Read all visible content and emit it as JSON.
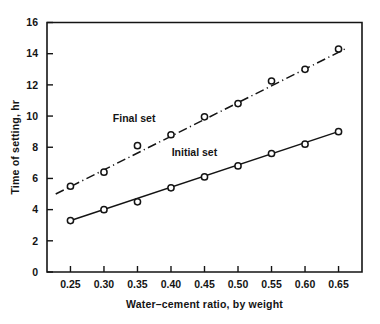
{
  "chart_data": {
    "type": "line",
    "title": "",
    "subtitle": "",
    "xlabel": "Water–cement ratio, by weight",
    "ylabel": "Time of setting, hr",
    "x": [
      0.25,
      0.3,
      0.35,
      0.4,
      0.45,
      0.5,
      0.55,
      0.6,
      0.65
    ],
    "xlim": [
      0.215,
      0.685
    ],
    "ylim": [
      0,
      16
    ],
    "xticks": [
      0.25,
      0.3,
      0.35,
      0.4,
      0.45,
      0.5,
      0.55,
      0.6,
      0.65
    ],
    "xtick_labels": [
      "0.25",
      "0.30",
      "0.35",
      "0.40",
      "0.45",
      "0.50",
      "0.55",
      "0.60",
      "0.65"
    ],
    "yticks": [
      0,
      2,
      4,
      6,
      8,
      10,
      12,
      14,
      16
    ],
    "ytick_labels": [
      "0",
      "2",
      "4",
      "6",
      "8",
      "10",
      "12",
      "14",
      "16"
    ],
    "grid": false,
    "legend_position": "inline-annotation",
    "series": [
      {
        "name": "Final set",
        "line_style": "dash-dot",
        "marker": "open-circle",
        "color": "#141414",
        "values": [
          5.5,
          6.4,
          8.1,
          8.8,
          9.95,
          10.8,
          12.25,
          13.0,
          14.3
        ],
        "trend_line": {
          "x_start": 0.228,
          "y_start": 5.0,
          "x_end": 0.662,
          "y_end": 14.35
        },
        "annotation": {
          "text": "Final set",
          "x": 0.345,
          "y": 9.6
        }
      },
      {
        "name": "Initial set",
        "line_style": "solid",
        "marker": "open-circle",
        "color": "#141414",
        "values": [
          3.3,
          4.0,
          4.5,
          5.4,
          6.1,
          6.8,
          7.6,
          8.2,
          9.0
        ],
        "trend_line": {
          "x_start": 0.247,
          "y_start": 3.25,
          "x_end": 0.653,
          "y_end": 9.05
        },
        "annotation": {
          "text": "Initial set",
          "x": 0.435,
          "y": 7.45
        }
      }
    ]
  }
}
